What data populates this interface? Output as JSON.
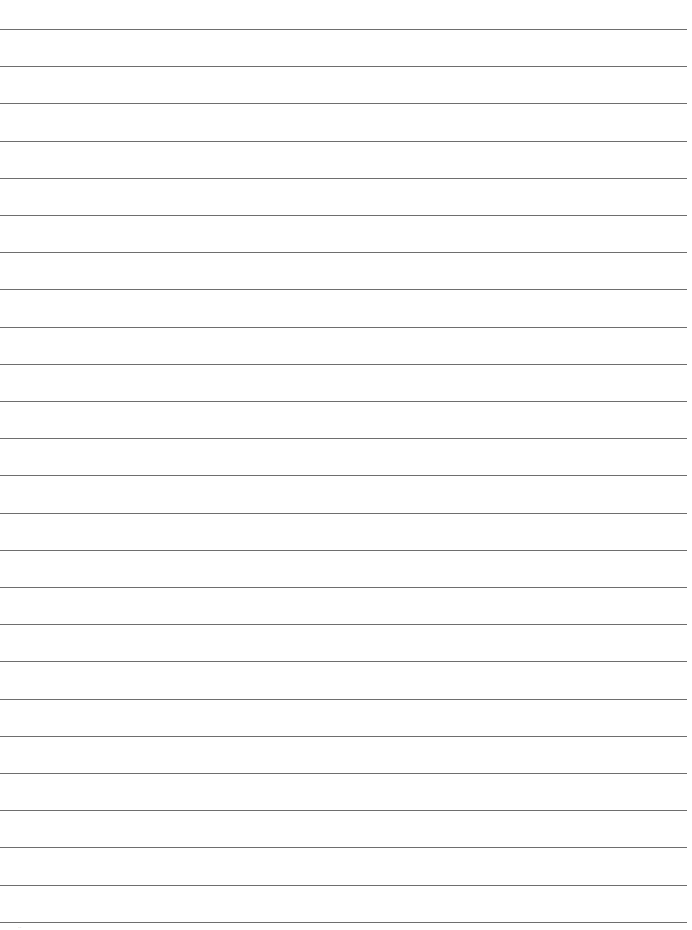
{
  "page": {
    "type": "lined-paper",
    "background_color": "#ffffff",
    "line_color": "#6e6e6e",
    "line_count": 25,
    "first_line_y": 29,
    "line_spacing": 37.2,
    "line_width": 687
  },
  "footer": {
    "corner_mark": "··"
  }
}
